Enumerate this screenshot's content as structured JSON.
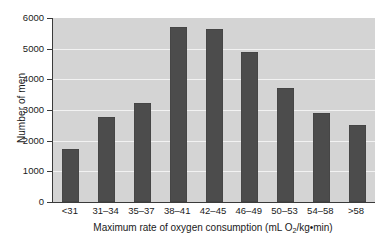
{
  "chart_data": {
    "type": "bar",
    "title": "",
    "subtitle": "",
    "xlabel_parts": {
      "before": "Maximum rate of oxygen consumption (mL O",
      "subscript": "2",
      "after": "/kg•min)"
    },
    "xlabel": "Maximum rate of oxygen consumption (mL O2/kg•min)",
    "ylabel": "Number of men",
    "categories": [
      "<31",
      "31–34",
      "35–37",
      "38–41",
      "42–45",
      "46–49",
      "50–53",
      "54–58",
      ">58"
    ],
    "values": [
      1730,
      2770,
      3230,
      5700,
      5640,
      4890,
      3720,
      2900,
      2510
    ],
    "ylim": [
      0,
      6000
    ],
    "yticks": [
      0,
      1000,
      2000,
      3000,
      4000,
      5000,
      6000
    ],
    "ytick_labels": [
      "0",
      "1000",
      "2000",
      "3000",
      "4000",
      "5000",
      "6000"
    ],
    "grid": true,
    "grid_axis": "y",
    "legend": "none",
    "bar_color": "#4c4c4c",
    "plot_background": "#d4d4d4",
    "gridline_color": "#f2f2f2",
    "axis_color": "#3a3a3a",
    "page_background": "#ffffff"
  }
}
